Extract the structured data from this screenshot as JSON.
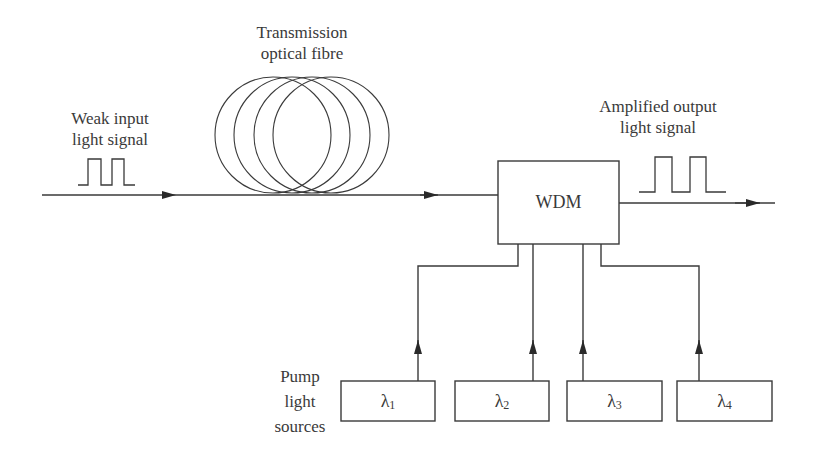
{
  "diagram": {
    "labels": {
      "input_line1": "Weak input",
      "input_line2": "light signal",
      "fibre_line1": "Transmission",
      "fibre_line2": "optical fibre",
      "output_line1": "Amplified output",
      "output_line2": "light signal",
      "pump_line1": "Pump",
      "pump_line2": "light",
      "pump_line3": "sources"
    },
    "wdm": {
      "label": "WDM"
    },
    "pumps": [
      {
        "symbol": "λ",
        "subscript": "1"
      },
      {
        "symbol": "λ",
        "subscript": "2"
      },
      {
        "symbol": "λ",
        "subscript": "3"
      },
      {
        "symbol": "λ",
        "subscript": "4"
      }
    ],
    "colors": {
      "stroke": "#3a3a3a",
      "background": "#ffffff"
    }
  }
}
